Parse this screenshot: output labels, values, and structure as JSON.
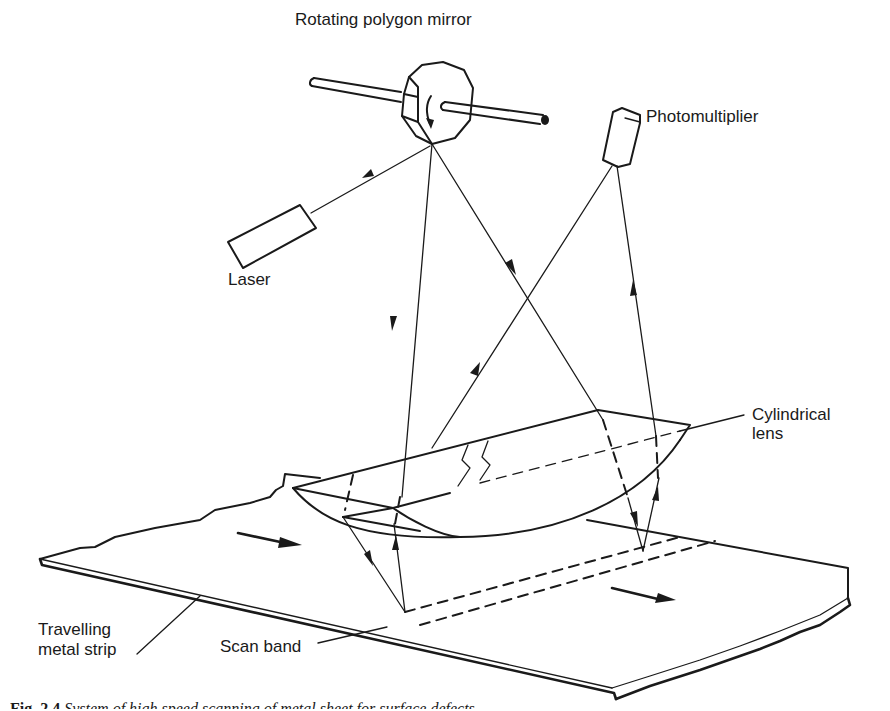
{
  "diagram": {
    "labels": {
      "mirror": "Rotating polygon mirror",
      "photomultiplier": "Photomultiplier",
      "laser": "Laser",
      "lens_line1": "Cylindrical",
      "lens_line2": "lens",
      "strip_line1": "Travelling",
      "strip_line2": "metal strip",
      "scan_band": "Scan band"
    },
    "components": [
      "rotating-polygon-mirror",
      "laser",
      "photomultiplier",
      "cylindrical-lens",
      "travelling-metal-strip",
      "scan-band"
    ],
    "colors": {
      "ink": "#1a1a1a",
      "background": "#ffffff"
    }
  },
  "caption": {
    "figure": "Fig. 2.4",
    "text": "System of high speed scanning of metal sheet for surface defects"
  }
}
